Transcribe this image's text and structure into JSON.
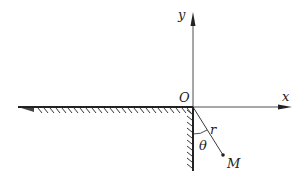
{
  "diagram": {
    "type": "geometry-coordinate-figure",
    "labels": {
      "y_axis": "y",
      "x_axis": "x",
      "origin": "O",
      "radius": "r",
      "angle": "θ",
      "point": "M"
    },
    "colors": {
      "line": "#222222",
      "background": "#ffffff"
    },
    "elements": [
      {
        "name": "x-axis",
        "description": "horizontal axis with arrow pointing right"
      },
      {
        "name": "y-axis",
        "description": "vertical axis with arrow pointing up"
      },
      {
        "name": "horizontal-wall",
        "description": "hatched wall along negative x-axis, hatching below"
      },
      {
        "name": "vertical-wall",
        "description": "hatched wall along negative y-axis, hatching on left"
      },
      {
        "name": "radius-line",
        "description": "segment from O to point M of length r"
      },
      {
        "name": "angle-arc",
        "description": "arc marking angle θ between vertical wall and r"
      },
      {
        "name": "point-M",
        "description": "dot at point M"
      }
    ]
  }
}
